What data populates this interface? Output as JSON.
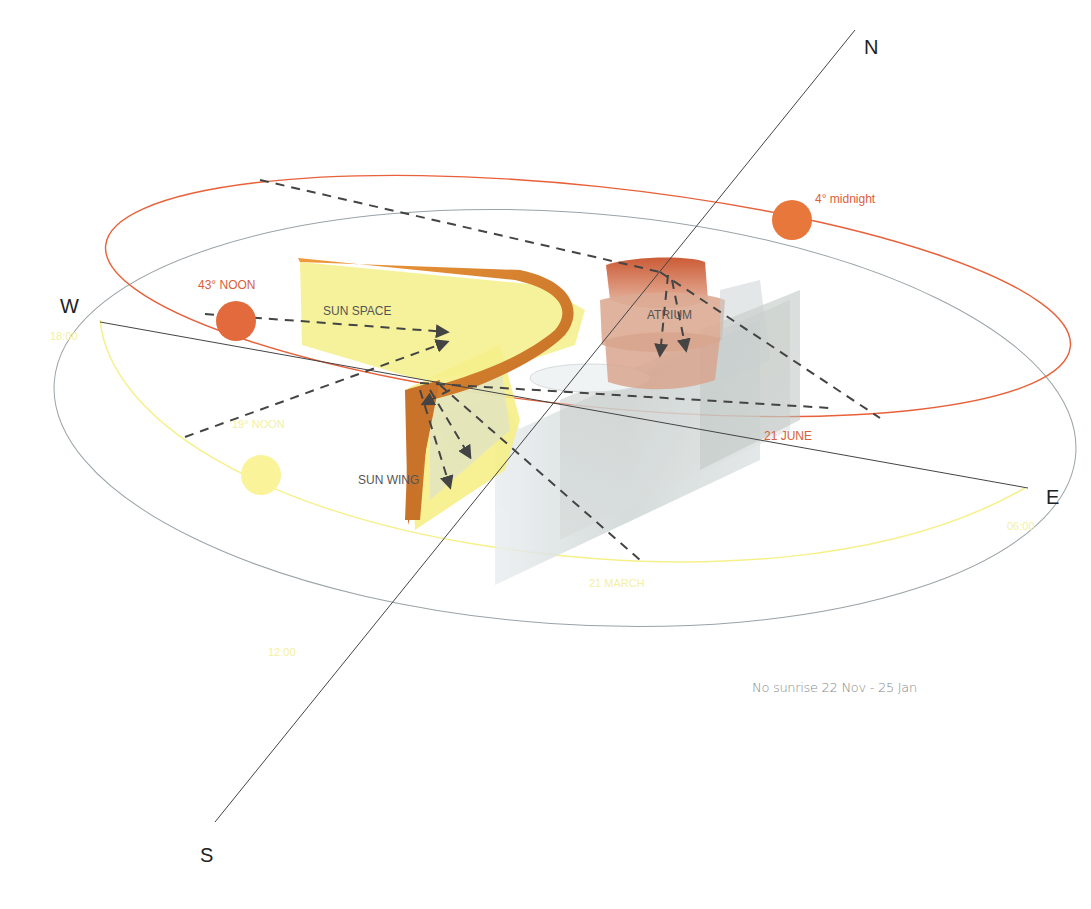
{
  "compass": {
    "north": "N",
    "south": "S",
    "east": "E",
    "west": "W"
  },
  "sun_paths": {
    "summer": {
      "label": "21 JUNE",
      "color": "#e8613a",
      "noon_label": "43° NOON",
      "midnight_label": "4° midnight"
    },
    "equinox": {
      "label": "21 MARCH",
      "color": "#f6f08a",
      "noon_label": "19° NOON",
      "times": [
        "18:00",
        "06:00",
        "12:00"
      ]
    }
  },
  "building": {
    "sun_space": "SUN SPACE",
    "atrium": "ATRIUM",
    "sun_wing": "SUN WING"
  },
  "note": "No sunrise 22 Nov - 25 Jan",
  "colors": {
    "orange": "#e8613a",
    "sun_orange": "#e26a3c",
    "yellow": "#f6f08a",
    "sun_yellow": "#faf39a",
    "horizon": "#9aa3a8",
    "axis": "#444444"
  }
}
